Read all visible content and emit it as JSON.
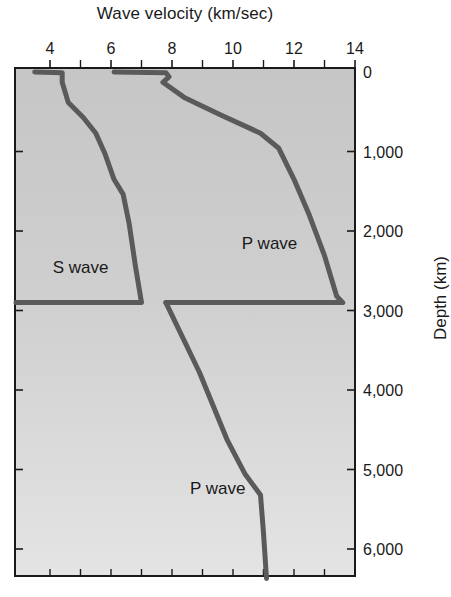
{
  "chart_data": {
    "type": "line",
    "title": "Wave velocity (km/sec)",
    "xlabel": "Wave velocity (km/sec)",
    "ylabel": "Depth (km)",
    "x_axis_position": "top",
    "y_axis_position": "right",
    "y_inverted": true,
    "xlim": [
      3,
      14
    ],
    "ylim": [
      6400,
      0
    ],
    "x_ticks": [
      4,
      6,
      8,
      10,
      12,
      14
    ],
    "x_tick_labels": [
      "4",
      "6",
      "8",
      "10",
      "12",
      "14"
    ],
    "x_minor_ticks": [
      5,
      7,
      9,
      11,
      13
    ],
    "y_ticks": [
      0,
      1000,
      2000,
      3000,
      4000,
      5000,
      6000
    ],
    "y_tick_labels": [
      "0",
      "1,000",
      "2,000",
      "3,000",
      "4,000",
      "5,000",
      "6,000"
    ],
    "grid": false,
    "legend": null,
    "annotations": [
      {
        "text": "S wave",
        "x": 5.0,
        "depth": 2450
      },
      {
        "text": "P wave",
        "x": 11.2,
        "depth": 2150
      },
      {
        "text": "P wave",
        "x": 9.5,
        "depth": 5230
      }
    ],
    "series": [
      {
        "name": "S wave",
        "points": [
          {
            "v": 3.5,
            "depth": 0
          },
          {
            "v": 4.4,
            "depth": 10
          },
          {
            "v": 4.4,
            "depth": 130
          },
          {
            "v": 4.6,
            "depth": 385
          },
          {
            "v": 5.1,
            "depth": 575
          },
          {
            "v": 5.5,
            "depth": 770
          },
          {
            "v": 5.8,
            "depth": 1025
          },
          {
            "v": 6.1,
            "depth": 1350
          },
          {
            "v": 6.4,
            "depth": 1540
          },
          {
            "v": 6.6,
            "depth": 1920
          },
          {
            "v": 6.8,
            "depth": 2440
          },
          {
            "v": 7.0,
            "depth": 2900
          },
          {
            "v": 0,
            "depth": 2900
          }
        ]
      },
      {
        "name": "P wave (mantle)",
        "points": [
          {
            "v": 6.1,
            "depth": 0
          },
          {
            "v": 7.8,
            "depth": 10
          },
          {
            "v": 7.9,
            "depth": 60
          },
          {
            "v": 7.7,
            "depth": 130
          },
          {
            "v": 8.4,
            "depth": 320
          },
          {
            "v": 9.6,
            "depth": 540
          },
          {
            "v": 10.9,
            "depth": 770
          },
          {
            "v": 11.5,
            "depth": 960
          },
          {
            "v": 12.0,
            "depth": 1350
          },
          {
            "v": 12.5,
            "depth": 1800
          },
          {
            "v": 13.0,
            "depth": 2310
          },
          {
            "v": 13.4,
            "depth": 2820
          },
          {
            "v": 13.6,
            "depth": 2900
          },
          {
            "v": 7.8,
            "depth": 2900
          }
        ]
      },
      {
        "name": "P wave (core)",
        "points": [
          {
            "v": 7.8,
            "depth": 2900
          },
          {
            "v": 8.9,
            "depth": 3780
          },
          {
            "v": 9.8,
            "depth": 4620
          },
          {
            "v": 10.4,
            "depth": 5060
          },
          {
            "v": 10.9,
            "depth": 5320
          },
          {
            "v": 11.0,
            "depth": 5800
          },
          {
            "v": 11.1,
            "depth": 6370
          }
        ]
      }
    ]
  },
  "colors": {
    "curve": "#5a5a5a",
    "axis": "#1a1a1a",
    "plot_bg_top": "#c6c6c6",
    "plot_bg_bottom": "#e4e4e4"
  }
}
